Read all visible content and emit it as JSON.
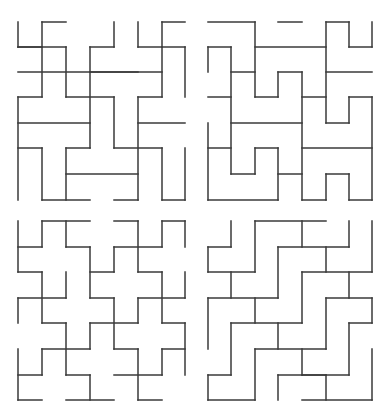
{
  "line_color": "#3a3a3a",
  "panels": [
    {
      "name": "top-left",
      "xs": [
        18,
        42,
        66,
        90,
        114,
        138,
        162,
        185
      ],
      "ys": [
        22,
        47,
        72,
        97,
        123,
        148,
        174,
        200
      ],
      "h": [
        [
          0,
          1,
          2
        ],
        [
          2,
          5,
          0
        ],
        [
          1,
          0,
          1
        ],
        [
          1,
          0,
          2
        ],
        [
          1,
          3,
          4
        ],
        [
          3,
          0,
          1
        ],
        [
          3,
          2,
          4
        ],
        [
          2,
          3,
          6
        ],
        [
          0,
          6,
          7
        ],
        [
          1,
          5,
          6
        ],
        [
          1,
          6,
          7
        ],
        [
          3,
          5,
          6
        ],
        [
          4,
          0,
          3
        ],
        [
          4,
          5,
          7
        ],
        [
          5,
          0,
          1
        ],
        [
          5,
          2,
          3
        ],
        [
          5,
          4,
          6
        ],
        [
          6,
          2,
          5
        ],
        [
          7,
          1,
          3
        ],
        [
          7,
          4,
          5
        ],
        [
          7,
          6,
          7
        ]
      ],
      "v": [
        [
          0,
          0,
          1
        ],
        [
          0,
          3,
          7
        ],
        [
          1,
          0,
          3
        ],
        [
          2,
          1,
          3
        ],
        [
          3,
          1,
          5
        ],
        [
          4,
          0,
          1
        ],
        [
          4,
          3,
          5
        ],
        [
          5,
          0,
          1
        ],
        [
          5,
          3,
          7
        ],
        [
          6,
          0,
          3
        ],
        [
          7,
          1,
          3
        ],
        [
          1,
          5,
          7
        ],
        [
          2,
          5,
          7
        ],
        [
          6,
          5,
          7
        ],
        [
          7,
          5,
          7
        ]
      ]
    },
    {
      "name": "top-right",
      "xs": [
        208,
        231,
        255,
        278,
        302,
        326,
        349,
        372
      ],
      "ys": [
        22,
        47,
        72,
        97,
        123,
        148,
        174,
        200
      ],
      "h": [
        [
          0,
          0,
          2
        ],
        [
          0,
          3,
          4
        ],
        [
          0,
          5,
          6
        ],
        [
          1,
          0,
          1
        ],
        [
          1,
          2,
          5
        ],
        [
          1,
          6,
          7
        ],
        [
          2,
          1,
          2
        ],
        [
          2,
          3,
          4
        ],
        [
          2,
          5,
          7
        ],
        [
          3,
          0,
          1
        ],
        [
          3,
          2,
          3
        ],
        [
          3,
          4,
          5
        ],
        [
          3,
          6,
          7
        ],
        [
          4,
          1,
          4
        ],
        [
          4,
          5,
          6
        ],
        [
          5,
          0,
          1
        ],
        [
          5,
          2,
          3
        ],
        [
          5,
          4,
          7
        ],
        [
          6,
          1,
          2
        ],
        [
          6,
          3,
          4
        ],
        [
          6,
          5,
          6
        ],
        [
          7,
          0,
          3
        ],
        [
          7,
          4,
          5
        ],
        [
          7,
          6,
          7
        ]
      ],
      "v": [
        [
          0,
          1,
          2
        ],
        [
          0,
          4,
          7
        ],
        [
          1,
          1,
          6
        ],
        [
          2,
          0,
          3
        ],
        [
          2,
          5,
          6
        ],
        [
          3,
          2,
          3
        ],
        [
          3,
          5,
          7
        ],
        [
          4,
          2,
          7
        ],
        [
          5,
          0,
          4
        ],
        [
          5,
          6,
          7
        ],
        [
          6,
          0,
          1
        ],
        [
          6,
          3,
          4
        ],
        [
          6,
          6,
          7
        ],
        [
          7,
          0,
          1
        ],
        [
          7,
          3,
          7
        ]
      ]
    },
    {
      "name": "bottom-left",
      "xs": [
        18,
        42,
        66,
        90,
        114,
        138,
        162,
        185
      ],
      "ys": [
        221,
        247,
        272,
        298,
        323,
        349,
        375,
        400
      ],
      "h": [
        [
          0,
          1,
          3
        ],
        [
          0,
          4,
          5
        ],
        [
          0,
          6,
          7
        ],
        [
          1,
          0,
          1
        ],
        [
          1,
          2,
          3
        ],
        [
          1,
          4,
          6
        ],
        [
          2,
          0,
          1
        ],
        [
          2,
          3,
          4
        ],
        [
          2,
          5,
          6
        ],
        [
          3,
          0,
          2
        ],
        [
          3,
          3,
          4
        ],
        [
          3,
          5,
          7
        ],
        [
          4,
          1,
          2
        ],
        [
          4,
          3,
          5
        ],
        [
          4,
          6,
          7
        ],
        [
          5,
          1,
          3
        ],
        [
          5,
          4,
          5
        ],
        [
          5,
          6,
          7
        ],
        [
          6,
          0,
          1
        ],
        [
          6,
          2,
          3
        ],
        [
          6,
          4,
          6
        ],
        [
          7,
          0,
          1
        ],
        [
          7,
          2,
          4
        ],
        [
          7,
          5,
          6
        ]
      ],
      "v": [
        [
          0,
          0,
          2
        ],
        [
          0,
          3,
          4
        ],
        [
          0,
          5,
          7
        ],
        [
          1,
          0,
          1
        ],
        [
          1,
          2,
          4
        ],
        [
          1,
          5,
          6
        ],
        [
          2,
          0,
          1
        ],
        [
          2,
          2,
          3
        ],
        [
          2,
          4,
          6
        ],
        [
          3,
          1,
          3
        ],
        [
          3,
          4,
          5
        ],
        [
          3,
          6,
          7
        ],
        [
          4,
          1,
          2
        ],
        [
          4,
          3,
          5
        ],
        [
          5,
          0,
          2
        ],
        [
          5,
          3,
          4
        ],
        [
          5,
          5,
          7
        ],
        [
          6,
          0,
          1
        ],
        [
          6,
          2,
          4
        ],
        [
          6,
          5,
          6
        ],
        [
          7,
          0,
          1
        ],
        [
          7,
          2,
          3
        ],
        [
          7,
          4,
          6
        ]
      ]
    },
    {
      "name": "bottom-right",
      "xs": [
        208,
        231,
        255,
        278,
        302,
        326,
        349,
        372
      ],
      "ys": [
        221,
        247,
        272,
        298,
        323,
        349,
        375,
        400
      ],
      "h": [
        [
          0,
          2,
          5
        ],
        [
          1,
          0,
          1
        ],
        [
          1,
          3,
          6
        ],
        [
          2,
          0,
          2
        ],
        [
          2,
          4,
          7
        ],
        [
          3,
          0,
          3
        ],
        [
          3,
          5,
          7
        ],
        [
          4,
          1,
          4
        ],
        [
          4,
          6,
          7
        ],
        [
          5,
          2,
          5
        ],
        [
          6,
          0,
          1
        ],
        [
          6,
          3,
          5
        ],
        [
          6,
          4,
          6
        ],
        [
          7,
          0,
          2
        ],
        [
          7,
          4,
          7
        ]
      ],
      "v": [
        [
          0,
          1,
          2
        ],
        [
          0,
          3,
          5
        ],
        [
          0,
          6,
          7
        ],
        [
          1,
          0,
          1
        ],
        [
          1,
          2,
          3
        ],
        [
          1,
          4,
          6
        ],
        [
          2,
          0,
          2
        ],
        [
          2,
          3,
          4
        ],
        [
          2,
          5,
          7
        ],
        [
          3,
          1,
          3
        ],
        [
          3,
          4,
          5
        ],
        [
          3,
          6,
          7
        ],
        [
          4,
          0,
          1
        ],
        [
          4,
          2,
          4
        ],
        [
          4,
          5,
          6
        ],
        [
          5,
          1,
          2
        ],
        [
          5,
          3,
          5
        ],
        [
          5,
          6,
          7
        ],
        [
          6,
          0,
          1
        ],
        [
          6,
          2,
          3
        ],
        [
          6,
          4,
          6
        ],
        [
          7,
          0,
          2
        ],
        [
          7,
          3,
          4
        ],
        [
          7,
          5,
          7
        ]
      ]
    }
  ]
}
